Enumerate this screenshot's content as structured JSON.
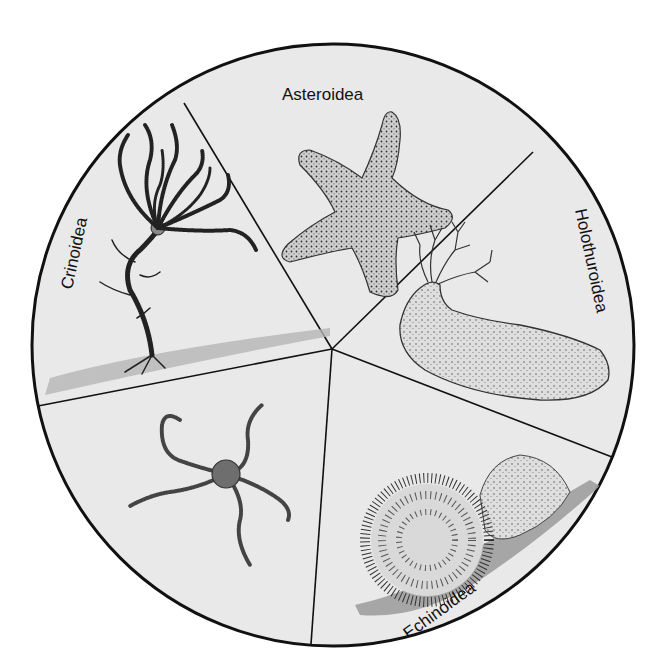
{
  "diagram": {
    "background": "#ffffff",
    "disc_fill": "#e9e9e9",
    "line_color": "#111111",
    "sectors": [
      {
        "id": "asteroidea",
        "label": "Asteroidea",
        "animal": "sea-star"
      },
      {
        "id": "holothuroidea",
        "label": "Holothuroidea",
        "animal": "sea-cucumber"
      },
      {
        "id": "echinoidea",
        "label": "Echinoidea",
        "animal": "sea-urchin"
      },
      {
        "id": "ophiuroidea",
        "label": "Ophiuroidea",
        "animal": "brittle-star"
      },
      {
        "id": "crinoidea",
        "label": "Crinoidea",
        "animal": "sea-lily"
      }
    ]
  }
}
